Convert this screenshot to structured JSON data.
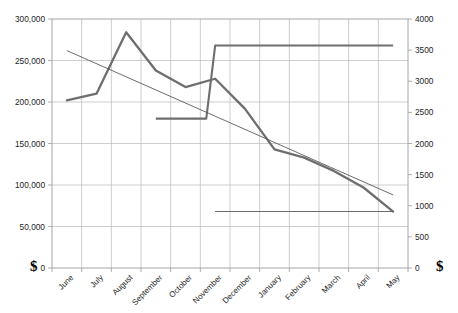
{
  "chart_data": {
    "type": "line",
    "title": "",
    "subtitle": "",
    "xlabel": "",
    "grid": true,
    "legend": "none",
    "categories": [
      "June",
      "July",
      "August",
      "September",
      "October",
      "November",
      "December",
      "January",
      "February",
      "March",
      "April",
      "May"
    ],
    "axes": {
      "left": {
        "label": "$",
        "ylim": [
          0,
          300000
        ],
        "tick_step": 50000,
        "ticks": [
          0,
          50000,
          100000,
          150000,
          200000,
          250000,
          300000
        ],
        "tick_labels": [
          "0",
          "50,000",
          "100,000",
          "150,000",
          "200,000",
          "250,000",
          "300,000"
        ]
      },
      "right": {
        "label": "$",
        "ylim": [
          0,
          4000
        ],
        "tick_step": 500,
        "ticks": [
          0,
          500,
          1000,
          1500,
          2000,
          2500,
          3000,
          3500,
          4000
        ],
        "tick_labels": [
          "0",
          "500",
          "1000",
          "1500",
          "2000",
          "2500",
          "3000",
          "3500",
          "4000"
        ]
      }
    },
    "series": [
      {
        "name": "main-line",
        "axis": "left",
        "style": "thick-line",
        "color": "#6e6e6e",
        "x": [
          "June",
          "July",
          "August",
          "September",
          "October",
          "November",
          "December",
          "January",
          "February",
          "March",
          "April",
          "May"
        ],
        "values": [
          202000,
          210000,
          284000,
          238000,
          218000,
          228000,
          192000,
          143000,
          133000,
          117000,
          97000,
          68000
        ]
      },
      {
        "name": "step-line",
        "axis": "left",
        "style": "step-line",
        "color": "#6e6e6e",
        "x": [
          "September",
          "October",
          "November",
          "December",
          "January",
          "February",
          "March",
          "April",
          "May"
        ],
        "values": [
          180000,
          180000,
          268000,
          268000,
          268000,
          268000,
          268000,
          268000,
          268000
        ]
      },
      {
        "name": "trendline",
        "axis": "left",
        "style": "thin-straight-line",
        "color": "#5a5a5a",
        "x": [
          "June",
          "May"
        ],
        "values": [
          262000,
          88000
        ]
      },
      {
        "name": "baseline-flat",
        "axis": "left",
        "style": "thin-flat-line",
        "color": "#6a6a6a",
        "x": [
          "November",
          "May"
        ],
        "values": [
          68000,
          68000
        ]
      }
    ],
    "series_right_axis_equivalent": {
      "main-line": [
        2693,
        2800,
        3787,
        3173,
        2907,
        3040,
        2560,
        1907,
        1773,
        1560,
        1293,
        907
      ],
      "step-line": [
        2400,
        2400,
        3573,
        3573,
        3573,
        3573,
        3573,
        3573,
        3573
      ],
      "trendline": [
        3493,
        1173
      ],
      "baseline-flat": [
        907,
        907
      ]
    }
  }
}
